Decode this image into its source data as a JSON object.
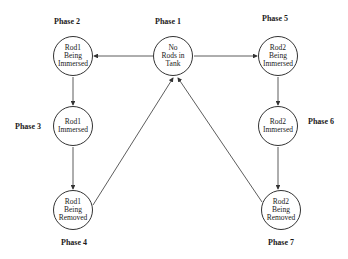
{
  "diagram": {
    "type": "state-transition",
    "nodes": [
      {
        "id": "n1",
        "phase": "Phase 1",
        "lines": [
          "No",
          "Rods in",
          "Tank"
        ]
      },
      {
        "id": "n2",
        "phase": "Phase 2",
        "lines": [
          "Rod1",
          "Being",
          "Immersed"
        ]
      },
      {
        "id": "n3",
        "phase": "Phase 3",
        "lines": [
          "Rod1",
          "Immersed"
        ]
      },
      {
        "id": "n4",
        "phase": "Phase 4",
        "lines": [
          "Rod1",
          "Being",
          "Removed"
        ]
      },
      {
        "id": "n5",
        "phase": "Phase 5",
        "lines": [
          "Rod2",
          "Being",
          "Immersed"
        ]
      },
      {
        "id": "n6",
        "phase": "Phase 6",
        "lines": [
          "Rod2",
          "Immersed"
        ]
      },
      {
        "id": "n7",
        "phase": "Phase 7",
        "lines": [
          "Rod2",
          "Being",
          "Removed"
        ]
      }
    ],
    "edges": [
      {
        "from": "n1",
        "to": "n2"
      },
      {
        "from": "n2",
        "to": "n3"
      },
      {
        "from": "n3",
        "to": "n4"
      },
      {
        "from": "n4",
        "to": "n1"
      },
      {
        "from": "n1",
        "to": "n5"
      },
      {
        "from": "n5",
        "to": "n6"
      },
      {
        "from": "n6",
        "to": "n7"
      },
      {
        "from": "n7",
        "to": "n1"
      }
    ]
  }
}
